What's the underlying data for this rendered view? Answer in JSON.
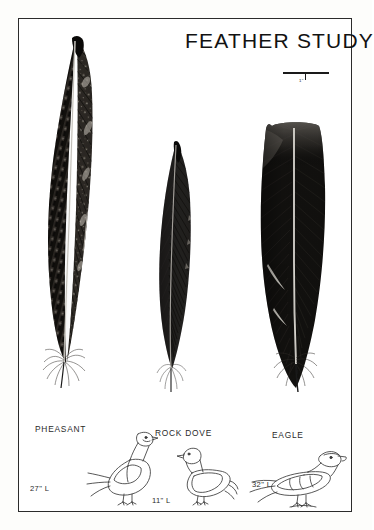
{
  "plate": {
    "title": "FEATHER STUDY",
    "background_color": "#ffffff",
    "frame_color": "#2b2b2b",
    "ink_color": "#1a1a1a"
  },
  "scale": {
    "label": "1\"",
    "icon": "scale-bar-icon"
  },
  "feathers": [
    {
      "id": "pheasant-feather",
      "species": "PHEASANT",
      "pattern": "barred-mottled",
      "tone": "#2a2724",
      "tip_shape": "pointed-curved"
    },
    {
      "id": "rock-dove-feather",
      "species": "ROCK DOVE",
      "pattern": "solid-fine-barb",
      "tone": "#1f1d1c",
      "tip_shape": "tapered"
    },
    {
      "id": "eagle-feather",
      "species": "EAGLE",
      "pattern": "solid-dark-broad",
      "tone": "#121110",
      "tip_shape": "squared-broad"
    }
  ],
  "specimens": [
    {
      "id": "pheasant",
      "label": "PHEASANT",
      "length": "27\" L",
      "icon": "pheasant-silhouette-icon"
    },
    {
      "id": "rock-dove",
      "label": "ROCK DOVE",
      "length": "11\" L",
      "icon": "rock-dove-silhouette-icon"
    },
    {
      "id": "eagle",
      "label": "EAGLE",
      "length": "32\" L",
      "icon": "eagle-silhouette-icon"
    }
  ]
}
